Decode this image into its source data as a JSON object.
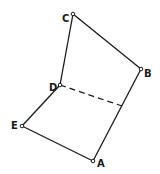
{
  "diagram": {
    "points": {
      "A": {
        "label": "A",
        "x": 93,
        "y": 161
      },
      "B": {
        "label": "B",
        "x": 141,
        "y": 69
      },
      "C": {
        "label": "C",
        "x": 73,
        "y": 14
      },
      "D": {
        "label": "D",
        "x": 60,
        "y": 85
      },
      "E": {
        "label": "E",
        "x": 22,
        "y": 126
      }
    },
    "edges": [
      {
        "from": "C",
        "to": "B",
        "style": "solid"
      },
      {
        "from": "B",
        "to": "A",
        "style": "solid"
      },
      {
        "from": "A",
        "to": "E",
        "style": "solid"
      },
      {
        "from": "E",
        "to": "D",
        "style": "solid"
      },
      {
        "from": "D",
        "to": "C",
        "style": "solid"
      },
      {
        "from": "D",
        "to": "AB",
        "style": "dashed"
      }
    ]
  }
}
